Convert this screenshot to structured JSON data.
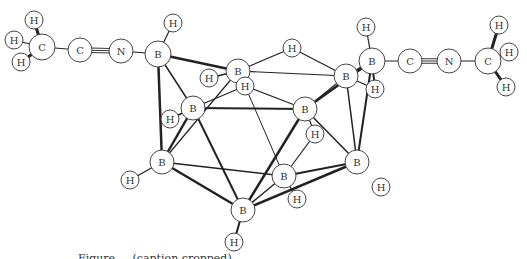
{
  "figure": {
    "caption": "Figure ... (caption cropped)",
    "atoms": [
      {
        "id": "H1",
        "el": "H",
        "x": 34,
        "y": 20,
        "r": 9
      },
      {
        "id": "H2",
        "el": "H",
        "x": 14,
        "y": 40,
        "r": 9
      },
      {
        "id": "H3",
        "el": "H",
        "x": 21,
        "y": 62,
        "r": 9
      },
      {
        "id": "C1",
        "el": "C",
        "x": 42,
        "y": 47,
        "r": 13
      },
      {
        "id": "C2",
        "el": "C",
        "x": 80,
        "y": 50,
        "r": 12
      },
      {
        "id": "N1",
        "el": "N",
        "x": 121,
        "y": 51,
        "r": 12
      },
      {
        "id": "B1",
        "el": "B",
        "x": 158,
        "y": 54,
        "r": 13
      },
      {
        "id": "H4",
        "el": "H",
        "x": 173,
        "y": 23,
        "r": 9
      },
      {
        "id": "B2",
        "el": "B",
        "x": 238,
        "y": 71,
        "r": 12
      },
      {
        "id": "H5",
        "el": "H",
        "x": 209,
        "y": 78,
        "r": 9
      },
      {
        "id": "H6",
        "el": "H",
        "x": 245,
        "y": 86,
        "r": 9
      },
      {
        "id": "H7",
        "el": "H",
        "x": 292,
        "y": 48,
        "r": 9
      },
      {
        "id": "B3",
        "el": "B",
        "x": 193,
        "y": 108,
        "r": 12
      },
      {
        "id": "H8",
        "el": "H",
        "x": 170,
        "y": 119,
        "r": 9
      },
      {
        "id": "B4",
        "el": "B",
        "x": 162,
        "y": 162,
        "r": 12
      },
      {
        "id": "H9",
        "el": "H",
        "x": 130,
        "y": 180,
        "r": 9
      },
      {
        "id": "B5",
        "el": "B",
        "x": 243,
        "y": 210,
        "r": 12
      },
      {
        "id": "H10",
        "el": "H",
        "x": 234,
        "y": 242,
        "r": 9
      },
      {
        "id": "B6",
        "el": "B",
        "x": 284,
        "y": 176,
        "r": 12
      },
      {
        "id": "H11",
        "el": "H",
        "x": 297,
        "y": 199,
        "r": 9
      },
      {
        "id": "B7",
        "el": "B",
        "x": 305,
        "y": 109,
        "r": 12
      },
      {
        "id": "H12",
        "el": "H",
        "x": 315,
        "y": 134,
        "r": 9
      },
      {
        "id": "B8",
        "el": "B",
        "x": 357,
        "y": 162,
        "r": 12
      },
      {
        "id": "H13",
        "el": "H",
        "x": 381,
        "y": 187,
        "r": 9
      },
      {
        "id": "B9",
        "el": "B",
        "x": 346,
        "y": 76,
        "r": 12
      },
      {
        "id": "B10",
        "el": "B",
        "x": 372,
        "y": 61,
        "r": 13
      },
      {
        "id": "H14",
        "el": "H",
        "x": 366,
        "y": 27,
        "r": 9
      },
      {
        "id": "H15",
        "el": "H",
        "x": 375,
        "y": 89,
        "r": 9
      },
      {
        "id": "C3",
        "el": "C",
        "x": 410,
        "y": 61,
        "r": 12
      },
      {
        "id": "N2",
        "el": "N",
        "x": 449,
        "y": 61,
        "r": 12
      },
      {
        "id": "C4",
        "el": "C",
        "x": 488,
        "y": 61,
        "r": 13
      },
      {
        "id": "H16",
        "el": "H",
        "x": 499,
        "y": 25,
        "r": 9
      },
      {
        "id": "H17",
        "el": "H",
        "x": 509,
        "y": 52,
        "r": 9
      },
      {
        "id": "H18",
        "el": "H",
        "x": 506,
        "y": 87,
        "r": 9
      }
    ],
    "bonds": [
      [
        "C1",
        "H1",
        3
      ],
      [
        "C1",
        "H2",
        1.2
      ],
      [
        "C1",
        "H3",
        3
      ],
      [
        "C1",
        "C2",
        1.2
      ],
      [
        "C2",
        "N1",
        "triple"
      ],
      [
        "N1",
        "B1",
        1.2
      ],
      [
        "B1",
        "H4",
        1.2
      ],
      [
        "B1",
        "B2",
        2.5
      ],
      [
        "B1",
        "B3",
        1.5
      ],
      [
        "B1",
        "B4",
        2.5
      ],
      [
        "B2",
        "H5",
        1.5
      ],
      [
        "B2",
        "H7",
        1.2
      ],
      [
        "B2",
        "B9",
        1.2
      ],
      [
        "B2",
        "H6",
        1
      ],
      [
        "B2",
        "B4",
        1.2
      ],
      [
        "H6",
        "B3",
        1.2
      ],
      [
        "H6",
        "B7",
        1.2
      ],
      [
        "H6",
        "B6",
        1
      ],
      [
        "H7",
        "B9",
        1.2
      ],
      [
        "B3",
        "H8",
        1.5
      ],
      [
        "B3",
        "B7",
        2
      ],
      [
        "B3",
        "B4",
        2.5
      ],
      [
        "B3",
        "B5",
        2
      ],
      [
        "B4",
        "H9",
        1.2
      ],
      [
        "B4",
        "B5",
        2.5
      ],
      [
        "B4",
        "B6",
        1.5
      ],
      [
        "B5",
        "H10",
        2
      ],
      [
        "B5",
        "B7",
        2.5
      ],
      [
        "B5",
        "B6",
        1.5
      ],
      [
        "B5",
        "B8",
        2.5
      ],
      [
        "B6",
        "H11",
        1.2
      ],
      [
        "B6",
        "B8",
        1.8
      ],
      [
        "B6",
        "H12",
        1.2
      ],
      [
        "B7",
        "B9",
        1.2
      ],
      [
        "B7",
        "B10",
        2.5
      ],
      [
        "B7",
        "B8",
        1.5
      ],
      [
        "B7",
        "H12",
        1.2
      ],
      [
        "B9",
        "B10",
        2
      ],
      [
        "B9",
        "B8",
        1.5
      ],
      [
        "B9",
        "H15",
        1.2
      ],
      [
        "B10",
        "H14",
        1.2
      ],
      [
        "B10",
        "H15",
        2
      ],
      [
        "B10",
        "B8",
        2
      ],
      [
        "B10",
        "C3",
        1.2
      ],
      [
        "C3",
        "N2",
        "triple"
      ],
      [
        "N2",
        "C4",
        1.2
      ],
      [
        "C4",
        "H16",
        3
      ],
      [
        "C4",
        "H17",
        1.2
      ],
      [
        "C4",
        "H18",
        3
      ]
    ]
  }
}
